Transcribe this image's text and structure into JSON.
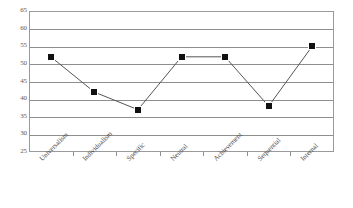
{
  "chart_data": {
    "type": "line",
    "title": "",
    "subtitle": "",
    "xlabel": "",
    "ylabel": "",
    "categories": [
      "Universalism",
      "Individualism",
      "Specific",
      "Neutral",
      "Achievement",
      "Sequential",
      "Internal"
    ],
    "values": [
      52,
      42,
      37,
      52,
      52,
      38,
      55
    ],
    "series": [
      {
        "name": "",
        "values": [
          52,
          42,
          37,
          52,
          52,
          38,
          55
        ]
      }
    ],
    "ylim": [
      25,
      65
    ],
    "yticks": [
      25,
      30,
      35,
      40,
      45,
      50,
      55,
      60,
      65
    ],
    "ytick_labels": [
      "25",
      "30",
      "35",
      "40",
      "45",
      "50",
      "55",
      "60",
      "65"
    ],
    "grid": true,
    "grid_axis": "y",
    "legend": false,
    "legend_position": "none",
    "marker": "square",
    "marker_color": "#111111",
    "line_color": "#555555",
    "plot_border_color": "#9a9a9a",
    "background_color": "#ffffff",
    "xtick_label_rotation": -45,
    "annotations": []
  }
}
